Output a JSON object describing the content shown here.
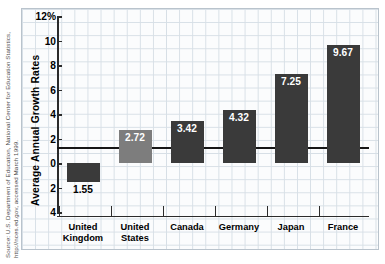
{
  "source_credit": {
    "line1": "Source: U.S. Department of Education, National Center for Education Statistics,",
    "line2": "http://nces.ed.gov, accessed March 1999."
  },
  "chart_data": {
    "type": "bar",
    "title": "",
    "xlabel": "",
    "ylabel": "Average Annual Growth Rates",
    "categories": [
      "United Kingdom",
      "United States",
      "Canada",
      "Germany",
      "Japan",
      "France"
    ],
    "category_lines": [
      [
        "United",
        "Kingdom"
      ],
      [
        "United",
        "States"
      ],
      [
        "Canada",
        ""
      ],
      [
        "Germany",
        ""
      ],
      [
        "Japan",
        ""
      ],
      [
        "France",
        ""
      ]
    ],
    "values": [
      -1.55,
      2.72,
      3.42,
      4.32,
      7.25,
      9.67
    ],
    "value_labels": [
      "1.55",
      "2.72",
      "3.42",
      "4.32",
      "7.25",
      "9.67"
    ],
    "label_positions": [
      "outside",
      "inside",
      "inside",
      "inside",
      "inside",
      "inside"
    ],
    "bar_colors": [
      "#3a3a3a",
      "#7d7d7d",
      "#3a3a3a",
      "#3a3a3a",
      "#3a3a3a",
      "#3a3a3a"
    ],
    "ylim": [
      -4,
      12
    ],
    "ytick_values": [
      12,
      10,
      8,
      6,
      4,
      2,
      0,
      -2,
      -4
    ],
    "ytick_labels": [
      "12%",
      "10",
      "8",
      "6",
      "4",
      "2",
      "0",
      "2",
      "4"
    ],
    "grid": true,
    "grid_style": "graph-paper",
    "legend": "none",
    "accent_color": "#3a3a3a",
    "highlight_color": "#7d7d7d",
    "axis_color": "#2b2b2b",
    "grid_color": "#d7dfe6",
    "paper_color": "#fbfcfd"
  }
}
